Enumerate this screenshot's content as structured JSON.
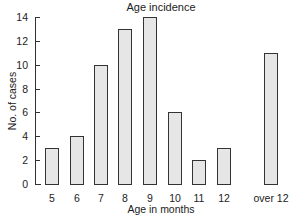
{
  "chart_data": {
    "type": "bar",
    "title": "Age incidence",
    "xlabel": "Age in months",
    "ylabel": "No. of cases",
    "categories": [
      "5",
      "6",
      "7",
      "8",
      "9",
      "10",
      "11",
      "12",
      "over 12"
    ],
    "values": [
      3,
      4,
      10,
      13,
      14,
      6,
      2,
      3,
      11
    ],
    "ylim": [
      0,
      14
    ],
    "yticks": [
      0,
      2,
      4,
      6,
      8,
      10,
      12,
      14
    ],
    "grid": false,
    "legend": "none",
    "bar_fill": "stippled grey"
  }
}
